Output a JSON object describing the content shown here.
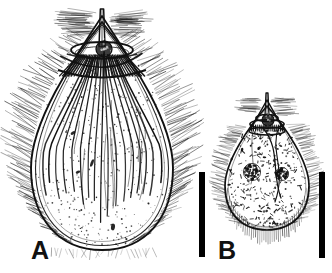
{
  "figure": {
    "type": "scientific-line-drawing",
    "background_color": "#ffffff",
    "ink_color": "#111111",
    "width_px": 332,
    "height_px": 273,
    "panel_count": 2
  },
  "panels": [
    {
      "id": "A",
      "label": "A",
      "label_position": {
        "x": 31,
        "y": 238
      },
      "description": "large pyriform ciliate with apical cone, apical spine, oral collar and longitudinal kineties",
      "body": {
        "center_x": 102,
        "center_y": 150,
        "radius_x": 71,
        "radius_y": 100,
        "apex_x": 102,
        "apex_y": 22,
        "bottom_y": 250
      },
      "apical_spine": {
        "top_y": 9,
        "base_y": 47,
        "half_width": 3
      },
      "oral_collar": {
        "center_x": 102,
        "center_y": 50,
        "radius_x": 31,
        "radius_y": 8
      },
      "oral_granule": {
        "center_x": 104,
        "center_y": 49,
        "radius": 8
      },
      "peristomial_band": {
        "center_x": 102,
        "top_y": 52,
        "bottom_y": 76,
        "half_width": 44
      },
      "kinety_count": 17,
      "cilia_fringe": "dense oblique fringe along both lateral margins and apical tufts",
      "stipple_density": "light",
      "inclusions": 4
    },
    {
      "id": "B",
      "label": "B",
      "label_position": {
        "x": 218,
        "y": 238
      },
      "description": "smaller pyriform ciliate, densely granular cytoplasm, two macronuclei, ventral ciliary fringe",
      "body": {
        "center_x": 267,
        "center_y": 176,
        "radius_x": 42,
        "radius_y": 54,
        "apex_x": 267,
        "apex_y": 106,
        "bottom_y": 230
      },
      "apical_spine": {
        "top_y": 93,
        "base_y": 116,
        "half_width": 2
      },
      "oral_collar": {
        "center_x": 267,
        "center_y": 122,
        "radius_x": 18,
        "radius_y": 5
      },
      "oral_granule": {
        "center_x": 268,
        "center_y": 120,
        "radius": 6
      },
      "macronuclei": [
        {
          "center_x": 252,
          "center_y": 172,
          "radius": 8
        },
        {
          "center_x": 282,
          "center_y": 174,
          "radius": 6
        }
      ],
      "kinety_count": 2,
      "cilia_fringe": "fine straight ciliary fringe along posterior and lateral margins",
      "stipple_density": "heavy",
      "inclusions": 120
    }
  ],
  "scale_bars": [
    {
      "id": "scale-bar-a",
      "for_panel": "A",
      "x": 199,
      "y": 172,
      "width": 6,
      "height": 85,
      "color": "#000000"
    },
    {
      "id": "scale-bar-b",
      "for_panel": "B",
      "x": 319,
      "y": 172,
      "width": 6,
      "height": 86,
      "color": "#000000"
    }
  ]
}
